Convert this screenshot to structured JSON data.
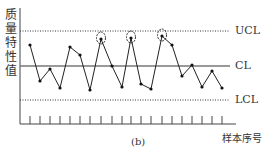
{
  "chart_data": {
    "type": "line",
    "title": "",
    "caption": "(b)",
    "xlabel": "样本序号",
    "ylabel": "质量特性值",
    "ylabel_chars": [
      "质",
      "量",
      "特",
      "性",
      "值"
    ],
    "control_lines": {
      "UCL": {
        "label": "UCL",
        "y_px": 31,
        "style": "dotted"
      },
      "CL": {
        "label": "CL",
        "y_px": 66,
        "style": "solid"
      },
      "LCL": {
        "label": "LCL",
        "y_px": 100,
        "style": "dotted"
      }
    },
    "x": [
      1,
      2,
      3,
      4,
      5,
      6,
      7,
      8,
      9,
      10,
      11,
      12,
      13,
      14,
      15,
      16,
      17,
      18,
      19,
      20
    ],
    "points_px": [
      [
        30,
        45
      ],
      [
        40,
        81
      ],
      [
        50,
        69
      ],
      [
        60,
        88
      ],
      [
        70,
        47
      ],
      [
        80,
        55
      ],
      [
        90,
        90
      ],
      [
        101,
        39
      ],
      [
        112,
        66
      ],
      [
        122,
        87
      ],
      [
        131,
        38
      ],
      [
        141,
        84
      ],
      [
        151,
        89
      ],
      [
        162,
        36
      ],
      [
        172,
        45
      ],
      [
        182,
        76
      ],
      [
        192,
        65
      ],
      [
        202,
        87
      ],
      [
        212,
        71
      ],
      [
        222,
        88
      ]
    ],
    "circled_points": [
      8,
      11,
      14
    ],
    "tick_count": 20,
    "grid": false,
    "legend": "none"
  }
}
